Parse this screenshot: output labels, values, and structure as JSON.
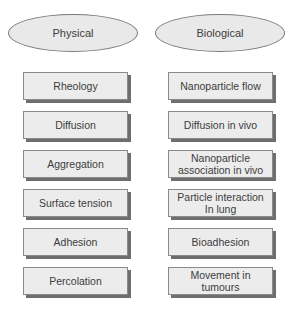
{
  "categories": {
    "physical": {
      "label": "Physical",
      "items": [
        "Rheology",
        "Diffusion",
        "Aggregation",
        "Surface tension",
        "Adhesion",
        "Percolation"
      ]
    },
    "biological": {
      "label": "Biological",
      "items": [
        "Nanoparticle flow",
        "Diffusion in vivo",
        "Nanoparticle association in vivo",
        "Particle interaction In lung",
        "Bioadhesion",
        "Movement in tumours"
      ]
    }
  },
  "colors": {
    "fill": "#ececec",
    "border": "#8a8a8a",
    "shadow": "#6e6e6e",
    "text": "#3c3c3c"
  }
}
